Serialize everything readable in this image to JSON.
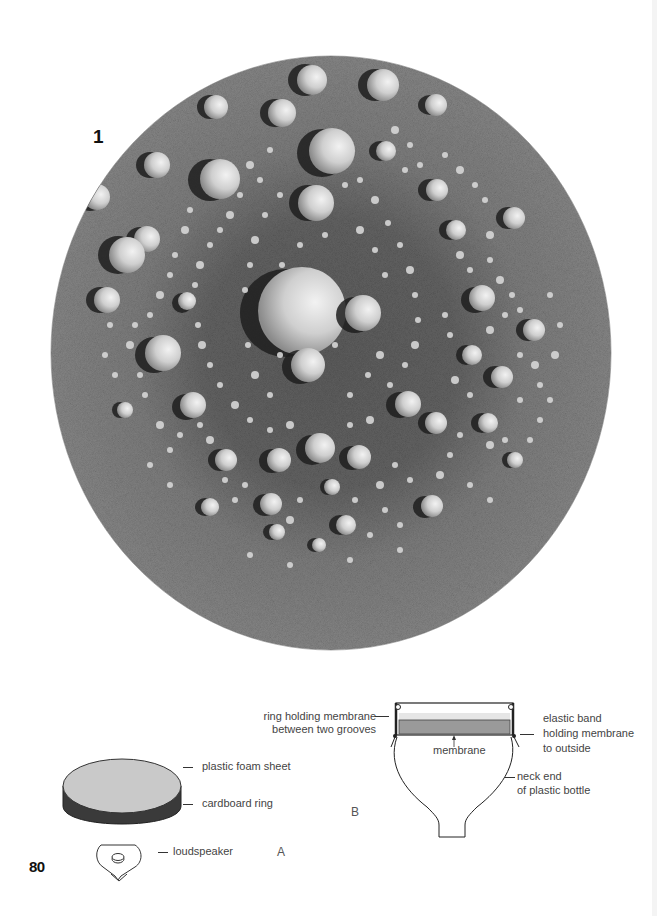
{
  "page": {
    "number": "80",
    "figure_number": "1"
  },
  "photo": {
    "description": "circular plate with sand/powder pattern of mounds in concentric rings"
  },
  "diagram_a": {
    "letter": "A",
    "labels": {
      "foam": "plastic foam sheet",
      "ring": "cardboard ring",
      "speaker": "loudspeaker"
    }
  },
  "diagram_b": {
    "letter": "B",
    "labels": {
      "ring_line1": "ring holding membrane",
      "ring_line2": "between two grooves",
      "membrane": "membrane",
      "elastic_line1": "elastic band",
      "elastic_line2": "holding membrane",
      "elastic_line3": "to outside",
      "neck_line1": "neck end",
      "neck_line2": "of plastic bottle"
    }
  },
  "colors": {
    "plate_dark": "#5a5a5a",
    "plate_mid": "#7a7a7a",
    "mound_light": "#e8e8e8",
    "foam_gray": "#c8c8c8",
    "ring_dark": "#3a3a3a",
    "membrane_gray": "#9a9a9a"
  }
}
